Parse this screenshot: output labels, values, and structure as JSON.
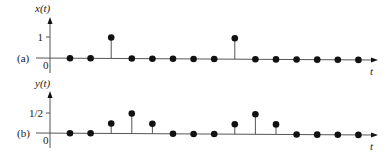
{
  "chart_data": [
    {
      "type": "stem",
      "panel_label": "(a)",
      "ylabel": "x(t)",
      "xlabel": "t",
      "ytick_labels": [
        "0",
        "1"
      ],
      "ytick_values": [
        0,
        1
      ],
      "x": [
        0,
        1,
        2,
        3,
        4,
        5,
        6,
        7,
        8,
        9,
        10,
        11,
        12,
        13,
        14
      ],
      "values": [
        0,
        0,
        1,
        0,
        0,
        0,
        0,
        0,
        1,
        0,
        0,
        0,
        0,
        0,
        0
      ]
    },
    {
      "type": "stem",
      "panel_label": "(b)",
      "ylabel": "y(t)",
      "xlabel": "t",
      "ytick_labels": [
        "0",
        "1/2"
      ],
      "ytick_values": [
        0,
        0.5
      ],
      "x": [
        0,
        1,
        2,
        3,
        4,
        5,
        6,
        7,
        8,
        9,
        10,
        11,
        12,
        13,
        14
      ],
      "values": [
        0,
        0,
        0.25,
        0.5,
        0.25,
        0,
        0,
        0,
        0.25,
        0.5,
        0.25,
        0,
        0,
        0,
        0
      ]
    }
  ],
  "colors": {
    "ink": "#111111",
    "axis": "#555555"
  }
}
